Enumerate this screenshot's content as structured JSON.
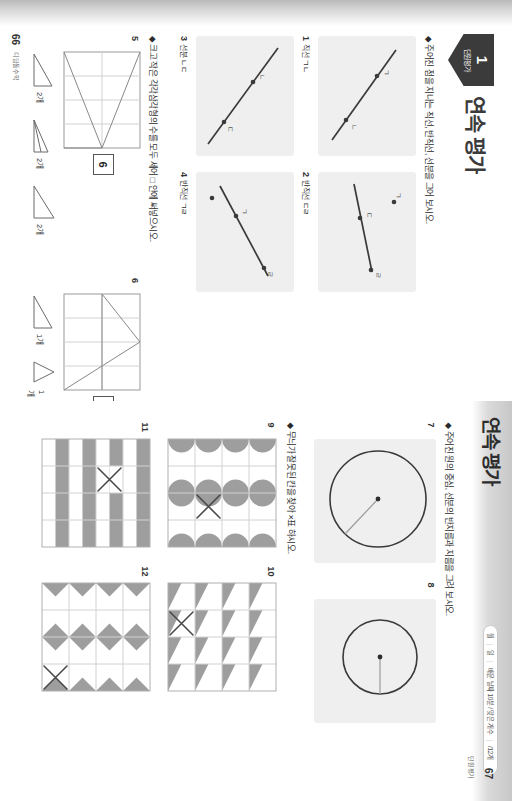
{
  "document": {
    "type": "math-workbook-spread",
    "orientation": "rotated-90"
  },
  "left_page": {
    "number": "66",
    "footer": "디딤돌수학",
    "chapter_badge": {
      "number": "1",
      "label": "단원평가"
    },
    "unit_title": "연속 평가",
    "instructions": [
      "◆ 주어진 점을 지나는 직선, 반직선, 선분을 그어 보시오.",
      "◆ 크고 작은 각각삼각형의 수를 모두 세어 □ 안에 써넣으시오."
    ],
    "line_items": [
      {
        "num": "1",
        "label": "직선 ㄱㄴ"
      },
      {
        "num": "2",
        "label": "반직선 ㄷㄹ"
      },
      {
        "num": "3",
        "label": "선분 ㄴㄷ"
      },
      {
        "num": "4",
        "label": "반직선 ㄱㄹ"
      }
    ],
    "point_labels": [
      "ㄱ",
      "ㄴ",
      "ㄷ",
      "ㄹ"
    ],
    "triangle_items": [
      {
        "num": "5",
        "answer": "6",
        "counts": [
          "2개",
          "2개",
          "2개"
        ]
      },
      {
        "num": "6",
        "answer": "3",
        "counts": [
          "1개",
          "1개",
          "1개"
        ]
      }
    ]
  },
  "right_page": {
    "number": "67",
    "footer": "단원평가",
    "header_title": "연속 평가",
    "header_pill": {
      "cells": [
        "월",
        "일",
        "배운 날짜 10분 / 맞은 개수",
        "/12개"
      ]
    },
    "instructions": [
      "◆ 주어진 원의 중심, 선분의 반지름과 지름을 그려 보시오.",
      "◆ 무늬가 잘못된 칸을 찾아 ×표 하시오."
    ],
    "circle_items": [
      {
        "num": "7",
        "kind": "radius-large"
      },
      {
        "num": "8",
        "kind": "radius-small"
      }
    ],
    "pattern_items": [
      {
        "num": "9",
        "pattern": "semicircles"
      },
      {
        "num": "10",
        "pattern": "right-triangles"
      },
      {
        "num": "11",
        "pattern": "horizontal-stripes"
      },
      {
        "num": "12",
        "pattern": "diamonds"
      }
    ]
  },
  "colors": {
    "shade": "#9e9e9e",
    "grid_line": "#d2d2d2",
    "figure_bg": "#efefef",
    "ink": "#2d2d2d",
    "badge": "#3b3b3b"
  }
}
